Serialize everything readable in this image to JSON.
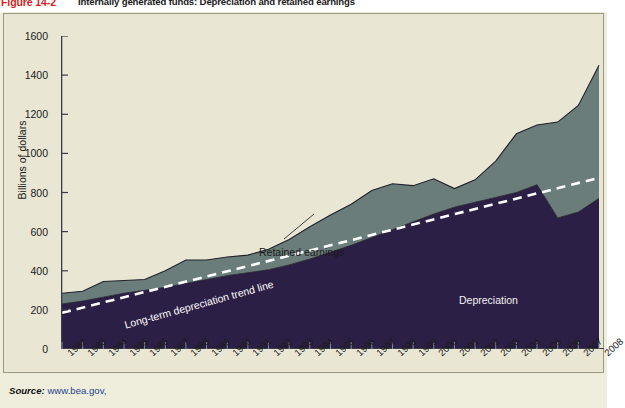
{
  "figure": {
    "number": "Figure 14-2",
    "title": "Internally generated funds: Depreciation and retained earnings"
  },
  "source": {
    "label": "Source:",
    "url": "www.bea.gov,"
  },
  "annotations": {
    "retained_earnings": "Retained earnings",
    "depreciation": "Depreciation",
    "trend_line": "Long-term depreciation trend line"
  },
  "colors": {
    "background": "#e9e7d3",
    "depreciation": "#2c1f45",
    "retained_earnings": "#6b7d7a",
    "trend_line": "#ffffff",
    "figure_number": "#cf1f24",
    "source_url": "#1b3f8f",
    "axis": "#3a3a48"
  },
  "chart_data": {
    "type": "area",
    "stacked": true,
    "title": "Internally generated funds: Depreciation and retained earnings",
    "xlabel": "",
    "ylabel": "Billions of dollars",
    "ylim": [
      0,
      1600
    ],
    "yticks": [
      0,
      200,
      400,
      600,
      800,
      1000,
      1200,
      1400,
      1600
    ],
    "grid": false,
    "legend_position": "inline-annotations",
    "categories": [
      "1982",
      "1983",
      "1984",
      "1985",
      "1986",
      "1987",
      "1988",
      "1989",
      "1990",
      "1991",
      "1992",
      "1993",
      "1994",
      "1995",
      "1996",
      "1997",
      "1998",
      "1999",
      "2000",
      "2001",
      "2002",
      "2003",
      "2004",
      "2005",
      "2006",
      "2007",
      "2008"
    ],
    "series": [
      {
        "name": "Depreciation",
        "values": [
          230,
          245,
          265,
          285,
          300,
          315,
          335,
          355,
          375,
          390,
          405,
          430,
          460,
          495,
          530,
          570,
          610,
          650,
          690,
          725,
          750,
          775,
          800,
          840,
          670,
          700,
          770
        ]
      },
      {
        "name": "Retained earnings",
        "values": [
          55,
          50,
          80,
          65,
          55,
          85,
          120,
          100,
          95,
          90,
          105,
          130,
          165,
          190,
          210,
          240,
          235,
          185,
          180,
          95,
          115,
          185,
          300,
          305,
          490,
          545,
          680
        ]
      }
    ],
    "totals": [
      285,
      295,
      345,
      350,
      355,
      400,
      455,
      455,
      470,
      480,
      510,
      560,
      625,
      685,
      740,
      810,
      845,
      835,
      870,
      820,
      865,
      960,
      1100,
      1145,
      1160,
      1245,
      1450
    ],
    "trend_line": {
      "name": "Long-term depreciation trend line",
      "style": "dashed",
      "color": "#ffffff",
      "start": {
        "x": "1982",
        "y": 185
      },
      "end": {
        "x": "2008",
        "y": 875
      }
    }
  }
}
